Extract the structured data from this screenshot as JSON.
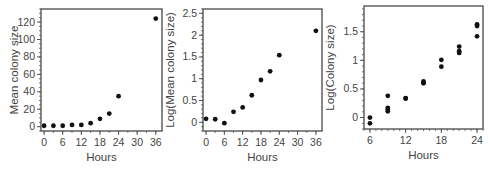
{
  "chart_data": [
    {
      "type": "scatter",
      "title": "",
      "xlabel": "Hours",
      "ylabel": "Mean colony size",
      "xlim": [
        -1,
        38
      ],
      "ylim": [
        -5,
        135
      ],
      "xticks": [
        0,
        6,
        12,
        18,
        24,
        30,
        36
      ],
      "yticks": [
        0,
        20,
        40,
        60,
        80,
        100,
        120
      ],
      "grid": false,
      "legend": null,
      "x": [
        0,
        3,
        6,
        9,
        12,
        15,
        18,
        21,
        24,
        36
      ],
      "y": [
        1,
        1,
        1,
        2,
        2,
        4,
        9,
        15,
        35,
        124
      ]
    },
    {
      "type": "scatter",
      "title": "",
      "xlabel": "Hours",
      "ylabel": "Log(Mean colony size)",
      "xlim": [
        -1,
        38
      ],
      "ylim": [
        -0.2,
        2.6
      ],
      "xticks": [
        0,
        6,
        12,
        18,
        24,
        30,
        36
      ],
      "yticks": [
        0,
        0.5,
        1,
        1.5,
        2,
        2.5
      ],
      "grid": false,
      "legend": null,
      "x": [
        0,
        3,
        6,
        9,
        12,
        15,
        18,
        21,
        24,
        36
      ],
      "y": [
        0.08,
        0.07,
        -0.02,
        0.24,
        0.34,
        0.62,
        0.97,
        1.17,
        1.54,
        2.1
      ]
    },
    {
      "type": "scatter",
      "title": "",
      "xlabel": "Hours",
      "ylabel": "Log(Colony size)",
      "xlim": [
        5,
        25
      ],
      "ylim": [
        -0.2,
        1.95
      ],
      "xticks": [
        6,
        12,
        18,
        24
      ],
      "yticks": [
        0,
        0.5,
        1,
        1.5
      ],
      "grid": false,
      "legend": null,
      "x": [
        6,
        6,
        9,
        9,
        9,
        9,
        12,
        12,
        15,
        15,
        15,
        18,
        18,
        21,
        21,
        21,
        24,
        24,
        24
      ],
      "y": [
        0.0,
        -0.1,
        0.38,
        0.17,
        0.14,
        0.11,
        0.34,
        0.33,
        0.63,
        0.61,
        0.6,
        1.01,
        0.89,
        1.24,
        1.16,
        1.13,
        1.63,
        1.6,
        1.42
      ]
    }
  ],
  "panels": [
    {
      "ylabel": "Mean colony size",
      "xlabel": "Hours",
      "xtick_labels": [
        "0",
        "6",
        "12",
        "18",
        "24",
        "30",
        "36"
      ],
      "ytick_labels": [
        "0",
        "20",
        "40",
        "60",
        "80",
        "100",
        "120"
      ]
    },
    {
      "ylabel": "Log(Mean colony size)",
      "xlabel": "Hours",
      "xtick_labels": [
        "0",
        "6",
        "12",
        "18",
        "24",
        "30",
        "36"
      ],
      "ytick_labels": [
        "0",
        "0.5",
        "1",
        "1.5",
        "2",
        "2.5"
      ]
    },
    {
      "ylabel": "Log(Colony size)",
      "xlabel": "Hours",
      "xtick_labels": [
        "6",
        "12",
        "18",
        "24"
      ],
      "ytick_labels": [
        "0",
        "0.5",
        "1",
        "1.5"
      ]
    }
  ],
  "colors": {
    "frame": "#555555",
    "marker": "#111111",
    "text": "#444444"
  }
}
